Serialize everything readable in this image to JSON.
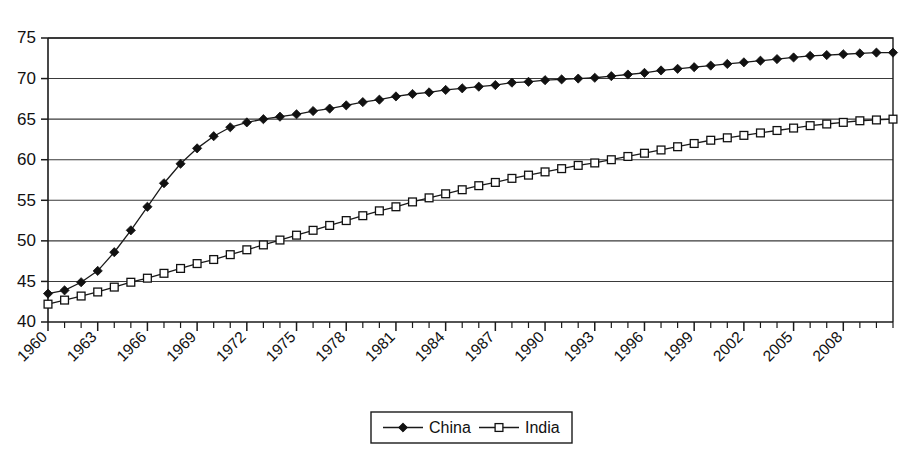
{
  "chart_data": {
    "type": "line",
    "title": "",
    "subtitle": "",
    "xlabel": "",
    "ylabel": "",
    "xlim": [
      1960,
      2011
    ],
    "ylim": [
      40,
      75
    ],
    "y_ticks": [
      40,
      45,
      50,
      55,
      60,
      65,
      70,
      75
    ],
    "grid": "horizontal",
    "legend_position": "bottom-center",
    "x_tick_labels": [
      "1960",
      "1963",
      "1966",
      "1969",
      "1972",
      "1975",
      "1978",
      "1981",
      "1984",
      "1987",
      "1990",
      "1993",
      "1996",
      "1999",
      "2002",
      "2005",
      "2008"
    ],
    "x_tick_label_years": [
      1960,
      1963,
      1966,
      1969,
      1972,
      1975,
      1978,
      1981,
      1984,
      1987,
      1990,
      1993,
      1996,
      1999,
      2002,
      2005,
      2008
    ],
    "x_tick_label_rotation_deg": 45,
    "x": [
      1960,
      1961,
      1962,
      1963,
      1964,
      1965,
      1966,
      1967,
      1968,
      1969,
      1970,
      1971,
      1972,
      1973,
      1974,
      1975,
      1976,
      1977,
      1978,
      1979,
      1980,
      1981,
      1982,
      1983,
      1984,
      1985,
      1986,
      1987,
      1988,
      1989,
      1990,
      1991,
      1992,
      1993,
      1994,
      1995,
      1996,
      1997,
      1998,
      1999,
      2000,
      2001,
      2002,
      2003,
      2004,
      2005,
      2006,
      2007,
      2008,
      2009,
      2010,
      2011
    ],
    "series": [
      {
        "name": "China",
        "marker": "filled-diamond",
        "values": [
          43.5,
          43.9,
          44.9,
          46.3,
          48.6,
          51.3,
          54.2,
          57.1,
          59.5,
          61.4,
          62.9,
          64.0,
          64.6,
          65.0,
          65.3,
          65.6,
          66.0,
          66.3,
          66.7,
          67.1,
          67.4,
          67.8,
          68.1,
          68.3,
          68.6,
          68.8,
          69.0,
          69.2,
          69.5,
          69.6,
          69.8,
          69.9,
          70.0,
          70.1,
          70.3,
          70.5,
          70.7,
          71.0,
          71.2,
          71.4,
          71.6,
          71.8,
          72.0,
          72.2,
          72.4,
          72.6,
          72.8,
          72.9,
          73.0,
          73.1,
          73.2,
          73.2
        ]
      },
      {
        "name": "India",
        "marker": "open-square",
        "values": [
          42.2,
          42.7,
          43.2,
          43.7,
          44.3,
          44.9,
          45.4,
          46.0,
          46.6,
          47.2,
          47.7,
          48.3,
          48.9,
          49.5,
          50.1,
          50.7,
          51.3,
          51.9,
          52.5,
          53.1,
          53.7,
          54.2,
          54.8,
          55.3,
          55.8,
          56.3,
          56.8,
          57.2,
          57.7,
          58.1,
          58.5,
          58.9,
          59.3,
          59.6,
          60.0,
          60.4,
          60.8,
          61.2,
          61.6,
          62.0,
          62.4,
          62.7,
          63.0,
          63.3,
          63.6,
          63.9,
          64.2,
          64.4,
          64.6,
          64.8,
          64.9,
          65.0
        ]
      }
    ],
    "legend": [
      {
        "label": "China",
        "marker": "filled-diamond"
      },
      {
        "label": "India",
        "marker": "open-square"
      }
    ]
  }
}
